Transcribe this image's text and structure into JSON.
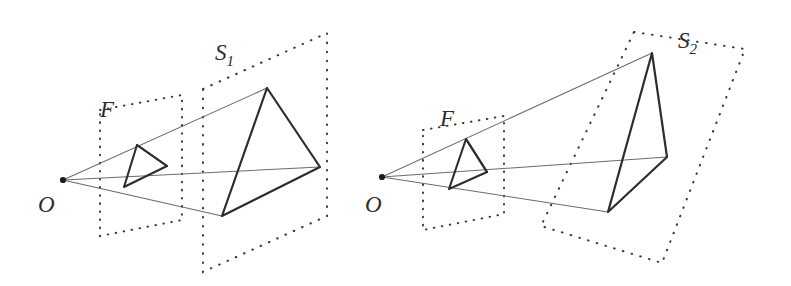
{
  "figure": {
    "background_color": "#ffffff",
    "ink_color": "#2d2d2d",
    "ray_color": "#5a5a5a",
    "dotted_color": "#3a3a3a"
  },
  "labels": {
    "origin_left": "O",
    "origin_right": "O",
    "near_plane_left": "F",
    "near_plane_right": "F",
    "far_plane_left_base": "S",
    "far_plane_left_sub": "1",
    "far_plane_right_base": "S",
    "far_plane_right_sub": "2"
  },
  "label_positions": {
    "origin_left": {
      "x": 38,
      "y": 212
    },
    "origin_right": {
      "x": 365,
      "y": 212
    },
    "near_plane_left": {
      "x": 100,
      "y": 117
    },
    "near_plane_right": {
      "x": 440,
      "y": 126
    },
    "far_plane_left": {
      "x": 215,
      "y": 60
    },
    "far_plane_right": {
      "x": 678,
      "y": 48
    }
  },
  "left_panel": {
    "name": "projection-onto-parallel-plane",
    "origin_point": {
      "x": 63,
      "y": 180
    },
    "near_plane_F": {
      "corners": [
        {
          "x": 100,
          "y": 110
        },
        {
          "x": 182,
          "y": 95
        },
        {
          "x": 182,
          "y": 220
        },
        {
          "x": 100,
          "y": 236
        }
      ]
    },
    "far_plane_S": {
      "corners": [
        {
          "x": 203,
          "y": 89
        },
        {
          "x": 327,
          "y": 33
        },
        {
          "x": 327,
          "y": 216
        },
        {
          "x": 203,
          "y": 272
        }
      ]
    },
    "near_triangle": {
      "apex": {
        "x": 137,
        "y": 145
      },
      "bottom_left": {
        "x": 124,
        "y": 187
      },
      "right": {
        "x": 167,
        "y": 166
      }
    },
    "far_triangle": {
      "apex": {
        "x": 267,
        "y": 88
      },
      "bottom_left": {
        "x": 222,
        "y": 216
      },
      "right": {
        "x": 320,
        "y": 167
      }
    }
  },
  "right_panel": {
    "name": "projection-onto-tilted-plane",
    "origin_point": {
      "x": 382,
      "y": 177
    },
    "near_plane_F": {
      "corners": [
        {
          "x": 423,
          "y": 130
        },
        {
          "x": 504,
          "y": 116
        },
        {
          "x": 504,
          "y": 214
        },
        {
          "x": 423,
          "y": 230
        }
      ]
    },
    "far_plane_S": {
      "corners": [
        {
          "x": 634,
          "y": 32
        },
        {
          "x": 745,
          "y": 49
        },
        {
          "x": 662,
          "y": 263
        },
        {
          "x": 541,
          "y": 226
        }
      ]
    },
    "near_triangle": {
      "apex": {
        "x": 466,
        "y": 139
      },
      "bottom_left": {
        "x": 449,
        "y": 189
      },
      "right": {
        "x": 487,
        "y": 172
      }
    },
    "far_triangle": {
      "apex": {
        "x": 652,
        "y": 53
      },
      "bottom_left": {
        "x": 608,
        "y": 212
      },
      "right": {
        "x": 667,
        "y": 157
      }
    }
  },
  "rays": {
    "description": "Straight projection rays from the viewpoint O through the near triangle vertices out to the far triangle vertices",
    "count_per_panel": 3
  }
}
